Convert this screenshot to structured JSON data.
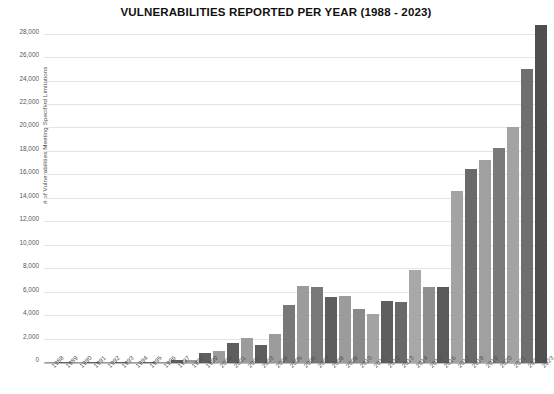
{
  "chart_data": {
    "type": "bar",
    "title": "VULNERABILITIES REPORTED PER YEAR (1988 - 2023)",
    "xlabel": "",
    "ylabel": "# of Vulnerabilities Meeting Specified Limitations",
    "ylim": [
      0,
      28000
    ],
    "ytick_step": 2000,
    "grid": true,
    "legend": "none",
    "categories": [
      "1988",
      "1989",
      "1990",
      "1991",
      "1992",
      "1993",
      "1994",
      "1995",
      "1996",
      "1997",
      "1998",
      "1999",
      "2000",
      "2001",
      "2002",
      "2003",
      "2004",
      "2005",
      "2006",
      "2007",
      "2008",
      "2009",
      "2010",
      "2011",
      "2012",
      "2013",
      "2014",
      "2015",
      "2016",
      "2017",
      "2018",
      "2019",
      "2020",
      "2021",
      "2022",
      "2023"
    ],
    "values": [
      2,
      3,
      12,
      15,
      13,
      13,
      25,
      25,
      75,
      252,
      246,
      894,
      1020,
      1677,
      2156,
      1527,
      2451,
      4935,
      6608,
      6517,
      5632,
      5732,
      4639,
      4150,
      5288,
      5186,
      7937,
      6487,
      6447,
      14645,
      16512,
      17344,
      18351,
      20153,
      25082,
      28818
    ],
    "bar_colors": [
      "#9c9c9c",
      "#5e5e5e",
      "#9c9c9c",
      "#5e5e5e",
      "#9c9c9c",
      "#5e5e5e",
      "#9c9c9c",
      "#5e5e5e",
      "#9c9c9c",
      "#5e5e5e",
      "#9c9c9c",
      "#5e5e5e",
      "#9c9c9c",
      "#5e5e5e",
      "#9c9c9c",
      "#5e5e5e",
      "#9c9c9c",
      "#787878",
      "#9c9c9c",
      "#787878",
      "#5e5e5e",
      "#9c9c9c",
      "#8a8a8a",
      "#a3a3a3",
      "#5e5e5e",
      "#686868",
      "#a8a8a8",
      "#8f8f8f",
      "#5a5a5a",
      "#a3a3a3",
      "#6a6a6a",
      "#a0a0a0",
      "#7a7a7a",
      "#a3a3a3",
      "#6f6f6f",
      "#4f4f4f"
    ],
    "ytick_labels": [
      "0",
      "2,000",
      "4,000",
      "6,000",
      "8,000",
      "10,000",
      "12,000",
      "14,000",
      "16,000",
      "18,000",
      "20,000",
      "22,000",
      "24,000",
      "26,000",
      "28,000"
    ],
    "ytick_values": [
      0,
      2000,
      4000,
      6000,
      8000,
      10000,
      12000,
      14000,
      16000,
      18000,
      20000,
      22000,
      24000,
      26000,
      28000
    ],
    "axis_color": "#bdbdbd",
    "grid_color": "#e4e4e4",
    "title_color": "#111111"
  }
}
